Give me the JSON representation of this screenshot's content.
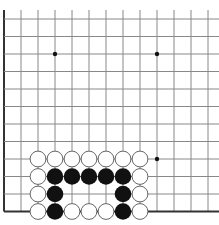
{
  "board": {
    "description": "Go board corner crop (lower-left edge region)",
    "columns": 13,
    "rows": 12,
    "origin_x": 4,
    "origin_y": 19,
    "spacing_x": 17,
    "spacing_y": 17.5,
    "top_y": 10,
    "right_x": 219,
    "left_edge": true,
    "bottom_edge": true,
    "colors": {
      "background": "#ffffff",
      "line": "#888888",
      "edge": "#333333",
      "black_stone": "#111111",
      "white_stone": "#ffffff",
      "white_stroke": "#555555",
      "star": "#111111"
    },
    "star_points": [
      {
        "col": 3,
        "row": 2
      },
      {
        "col": 9,
        "row": 2
      },
      {
        "col": 9,
        "row": 8
      }
    ],
    "stones": [
      {
        "col": 2,
        "row": 8,
        "color": "white"
      },
      {
        "col": 3,
        "row": 8,
        "color": "white"
      },
      {
        "col": 4,
        "row": 8,
        "color": "white"
      },
      {
        "col": 5,
        "row": 8,
        "color": "white"
      },
      {
        "col": 6,
        "row": 8,
        "color": "white"
      },
      {
        "col": 7,
        "row": 8,
        "color": "white"
      },
      {
        "col": 8,
        "row": 8,
        "color": "white"
      },
      {
        "col": 2,
        "row": 9,
        "color": "white"
      },
      {
        "col": 3,
        "row": 9,
        "color": "black"
      },
      {
        "col": 4,
        "row": 9,
        "color": "black"
      },
      {
        "col": 5,
        "row": 9,
        "color": "black"
      },
      {
        "col": 6,
        "row": 9,
        "color": "black"
      },
      {
        "col": 7,
        "row": 9,
        "color": "black"
      },
      {
        "col": 8,
        "row": 9,
        "color": "white"
      },
      {
        "col": 2,
        "row": 10,
        "color": "white"
      },
      {
        "col": 3,
        "row": 10,
        "color": "black"
      },
      {
        "col": 7,
        "row": 10,
        "color": "black"
      },
      {
        "col": 8,
        "row": 10,
        "color": "white"
      },
      {
        "col": 2,
        "row": 11,
        "color": "white"
      },
      {
        "col": 3,
        "row": 11,
        "color": "black"
      },
      {
        "col": 4,
        "row": 11,
        "color": "white"
      },
      {
        "col": 5,
        "row": 11,
        "color": "white"
      },
      {
        "col": 6,
        "row": 11,
        "color": "white"
      },
      {
        "col": 7,
        "row": 11,
        "color": "black"
      },
      {
        "col": 8,
        "row": 11,
        "color": "white"
      }
    ]
  }
}
